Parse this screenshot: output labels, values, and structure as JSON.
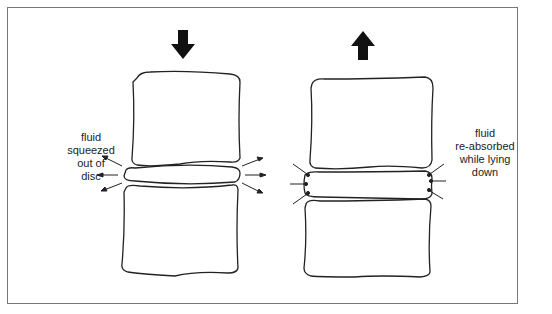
{
  "figure": {
    "left_panel": {
      "state": "compressed (standing)",
      "force_arrow": "down-arrow",
      "label_lines": [
        "fluid",
        "squeezed",
        "out of",
        "disc"
      ]
    },
    "right_panel": {
      "state": "decompressed (lying down)",
      "force_arrow": "up-arrow",
      "label_lines": [
        "fluid",
        "re-absorbed",
        "while lying",
        "down"
      ]
    },
    "colors": {
      "line": "#222222",
      "frame": "#777777",
      "background": "#ffffff"
    }
  }
}
